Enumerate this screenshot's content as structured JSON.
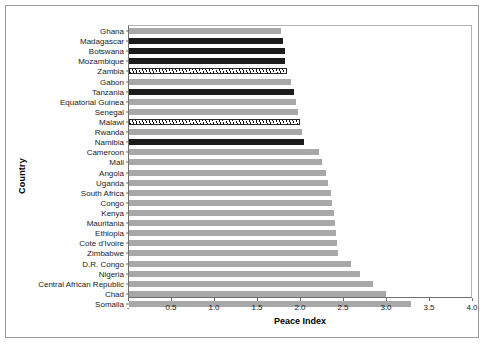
{
  "chart_data": {
    "type": "bar",
    "orientation": "horizontal",
    "title": "",
    "xlabel": "Peace Index",
    "ylabel": "Country",
    "xlim": [
      0,
      4.0
    ],
    "xticks": [
      0,
      0.5,
      1.0,
      1.5,
      2.0,
      2.5,
      3.0,
      3.5,
      4.0
    ],
    "xtick_labels": [
      "-",
      "0.5",
      "1.0",
      "1.5",
      "2.0",
      "2.5",
      "3.0",
      "3.5",
      "4.0"
    ],
    "grid": false,
    "legend": "none",
    "categories": [
      "Ghana",
      "Madagascar",
      "Botswana",
      "Mozambique",
      "Zambia",
      "Gabon",
      "Tanzania",
      "Equatorial Guinea",
      "Senegal",
      "Malawi",
      "Rwanda",
      "Namibia",
      "Cameroon",
      "Mali",
      "Angola",
      "Uganda",
      "South Africa",
      "Congo",
      "Kenya",
      "Mauritania",
      "Ethiopia",
      "Cote d'Ivoire",
      "Zimbabwe",
      "D.R. Congo",
      "Nigeria",
      "Central African Republic",
      "Chad",
      "Somalia"
    ],
    "values": [
      1.78,
      1.8,
      1.82,
      1.83,
      1.85,
      1.9,
      1.93,
      1.95,
      1.98,
      2.0,
      2.02,
      2.05,
      2.22,
      2.26,
      2.3,
      2.33,
      2.36,
      2.38,
      2.4,
      2.41,
      2.42,
      2.43,
      2.45,
      2.6,
      2.7,
      2.85,
      3.0,
      3.3
    ],
    "bar_styles": [
      "gray",
      "black",
      "black",
      "black",
      "hatch",
      "gray",
      "black",
      "gray",
      "gray",
      "hatch",
      "gray",
      "black",
      "gray",
      "gray",
      "gray",
      "gray",
      "gray",
      "gray",
      "gray",
      "gray",
      "gray",
      "gray",
      "gray",
      "gray",
      "gray",
      "gray",
      "gray",
      "gray"
    ],
    "colors": {
      "gray": "#a8a8a8",
      "black": "#1c1c1c",
      "hatch": "#ffffff",
      "axis": "#6f6f6f",
      "frame": "#9a9a9a"
    }
  }
}
